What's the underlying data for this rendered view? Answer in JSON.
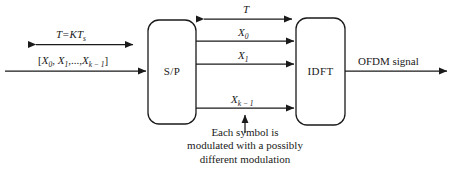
{
  "diagram": {
    "type": "block-diagram",
    "background_color": "#ffffff",
    "line_color": "#1a1a1a"
  },
  "blocks": [
    {
      "id": "sp",
      "label": "S/P",
      "x": 148,
      "y": 20,
      "w": 48,
      "h": 104
    },
    {
      "id": "idft",
      "label": "IDFT",
      "x": 296,
      "y": 18,
      "w": 49,
      "h": 107
    }
  ],
  "signals": {
    "period_label": "T=KT",
    "period_sub": "s",
    "input_sequence": "[X₀, X₁,..., Xₖ₋₁]",
    "input_open": "[",
    "input_x0": "X",
    "input_x0_sub": "0",
    "input_x1": "X",
    "input_x1_sub": "1",
    "input_ellipsis": ",...,",
    "input_xk": "X",
    "input_xk_sub": "k − 1",
    "input_close": "]",
    "symbol_duration": "T",
    "subcarrier_0": "X",
    "subcarrier_0_sub": "0",
    "subcarrier_1": "X",
    "subcarrier_1_sub": "1",
    "subcarrier_k": "X",
    "subcarrier_k_sub": "k − 1",
    "output": "OFDM signal"
  },
  "caption": {
    "line1": "Each symbol is",
    "line2": "modulated with a possibly",
    "line3": "different modulation"
  }
}
